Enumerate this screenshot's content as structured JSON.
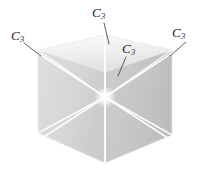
{
  "figure": {
    "name": "cube-c3-axes-diagram",
    "width": 207,
    "height": 182,
    "background_color": "#ffffff"
  },
  "colors": {
    "background": "#ffffff",
    "top_face": "#f0f0f0",
    "top_face_shade": "#e2e2e2",
    "left_face": "#d8d8d8",
    "left_face_shade": "#cfcfcf",
    "right_face": "#c9c9c9",
    "right_face_shade": "#bfbfbf",
    "axis_line": "#ffffff",
    "leader_line": "#3a3a3a",
    "label_text": "#1a1a1a",
    "edge_line": "#e8e8e8"
  },
  "labels": {
    "top": {
      "symbol": "C",
      "subscript": "3"
    },
    "left": {
      "symbol": "C",
      "subscript": "3"
    },
    "right": {
      "symbol": "C",
      "subscript": "3"
    },
    "center": {
      "symbol": "C",
      "subscript": "3"
    }
  },
  "geometry": {
    "center_point": {
      "x": 105,
      "y": 97
    },
    "vertices": {
      "back_top_left": {
        "x": 38,
        "y": 50
      },
      "back_top_center": {
        "x": 105,
        "y": 35
      },
      "back_top_right": {
        "x": 172,
        "y": 50
      },
      "front_top_center": {
        "x": 105,
        "y": 72
      },
      "front_bottom_left": {
        "x": 38,
        "y": 133
      },
      "front_bottom_center": {
        "x": 105,
        "y": 163
      },
      "front_bottom_right": {
        "x": 172,
        "y": 135
      }
    },
    "axis_count": 4,
    "axis_order": 3
  }
}
